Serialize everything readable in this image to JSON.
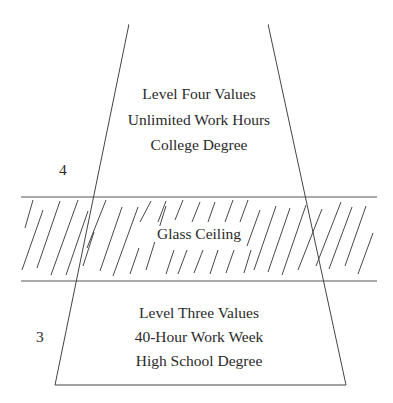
{
  "diagram": {
    "title": "",
    "colors": {
      "line": "#3a3a3a",
      "text": "#2a2a2a",
      "background": "#ffffff"
    },
    "upper_level": {
      "number": "4",
      "lines": [
        "Level Four Values",
        "Unlimited Work Hours",
        "College Degree"
      ]
    },
    "barrier": {
      "label": "Glass Ceiling"
    },
    "lower_level": {
      "number": "3",
      "lines": [
        "Level Three Values",
        "40-Hour Work Week",
        "High School Degree"
      ]
    },
    "geometry": {
      "trapezoid": {
        "top_left": [
          129,
          24
        ],
        "top_right": [
          268,
          24
        ],
        "bottom_left": [
          55,
          385
        ],
        "bottom_right": [
          346,
          385
        ]
      },
      "band": {
        "x1": 21,
        "x2": 377,
        "top_y": 197,
        "bottom_y": 281
      }
    }
  }
}
